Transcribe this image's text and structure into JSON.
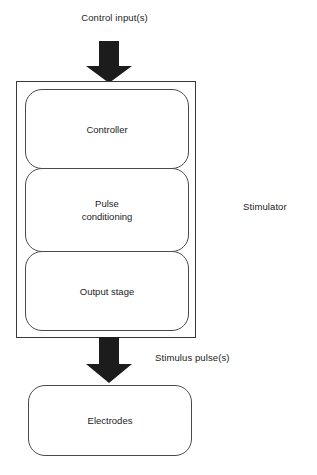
{
  "diagram": {
    "title_label": "Control input(s)",
    "system_label": "Stimulator",
    "output_label": "Stimulus pulse(s)",
    "colors": {
      "arrow_fill": "#1c1c1c",
      "stroke": "#3a3a3a",
      "background": "#ffffff",
      "text": "#222222"
    },
    "blocks": [
      {
        "label": "Controller"
      },
      {
        "label": "Pulse\nconditioning"
      },
      {
        "label": "Output stage"
      },
      {
        "label": "Electrodes"
      }
    ],
    "block_labels": {
      "controller": "Controller",
      "pulse_conditioning_line1": "Pulse",
      "pulse_conditioning_line2": "conditioning",
      "output_stage": "Output stage",
      "electrodes": "Electrodes"
    },
    "arrows": [
      {
        "name": "control-input-arrow",
        "direction": "down"
      },
      {
        "name": "stimulus-pulse-arrow",
        "direction": "down"
      }
    ]
  }
}
